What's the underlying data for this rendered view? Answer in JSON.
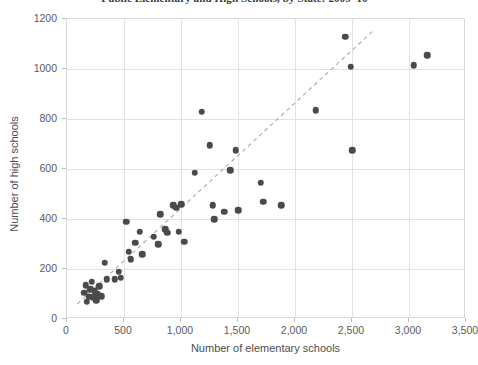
{
  "chart_data": {
    "type": "scatter",
    "title": "Public Elementary and High Schools, by State: 2009–10",
    "xlabel": "Number of elementary schools",
    "ylabel": "Number of high schools",
    "xlim": [
      0,
      3500
    ],
    "ylim": [
      0,
      1200
    ],
    "xticks": [
      0,
      500,
      1000,
      1500,
      2000,
      2500,
      3000,
      3500
    ],
    "xticklabels": [
      "0",
      "500",
      "1,000",
      "1,500",
      "2,000",
      "2,500",
      "3,000",
      "3,500"
    ],
    "yticks": [
      0,
      200,
      400,
      600,
      800,
      1000,
      1200
    ],
    "yticklabels": [
      "0",
      "200",
      "400",
      "600",
      "800",
      "1000",
      "1200"
    ],
    "grid": true,
    "legend": "none",
    "marker_color": "#4a4a4a",
    "trendline": {
      "style": "dashed",
      "color": "#b0b0b0",
      "x_start": 90,
      "y_start": 60,
      "x_end": 2690,
      "y_end": 1155
    },
    "points": [
      {
        "x": 150,
        "y": 105
      },
      {
        "x": 165,
        "y": 135
      },
      {
        "x": 175,
        "y": 70
      },
      {
        "x": 195,
        "y": 90
      },
      {
        "x": 205,
        "y": 120
      },
      {
        "x": 215,
        "y": 150
      },
      {
        "x": 230,
        "y": 88
      },
      {
        "x": 245,
        "y": 112
      },
      {
        "x": 255,
        "y": 75
      },
      {
        "x": 270,
        "y": 100
      },
      {
        "x": 285,
        "y": 132
      },
      {
        "x": 300,
        "y": 92
      },
      {
        "x": 330,
        "y": 225
      },
      {
        "x": 350,
        "y": 160
      },
      {
        "x": 420,
        "y": 160
      },
      {
        "x": 455,
        "y": 190
      },
      {
        "x": 470,
        "y": 165
      },
      {
        "x": 520,
        "y": 390
      },
      {
        "x": 540,
        "y": 270
      },
      {
        "x": 560,
        "y": 240
      },
      {
        "x": 600,
        "y": 305
      },
      {
        "x": 640,
        "y": 350
      },
      {
        "x": 660,
        "y": 260
      },
      {
        "x": 760,
        "y": 330
      },
      {
        "x": 800,
        "y": 300
      },
      {
        "x": 820,
        "y": 420
      },
      {
        "x": 860,
        "y": 360
      },
      {
        "x": 880,
        "y": 345
      },
      {
        "x": 930,
        "y": 455
      },
      {
        "x": 960,
        "y": 445
      },
      {
        "x": 980,
        "y": 350
      },
      {
        "x": 1000,
        "y": 460
      },
      {
        "x": 1030,
        "y": 310
      },
      {
        "x": 1120,
        "y": 585
      },
      {
        "x": 1180,
        "y": 830
      },
      {
        "x": 1250,
        "y": 695
      },
      {
        "x": 1280,
        "y": 455
      },
      {
        "x": 1290,
        "y": 400
      },
      {
        "x": 1380,
        "y": 430
      },
      {
        "x": 1430,
        "y": 595
      },
      {
        "x": 1480,
        "y": 675
      },
      {
        "x": 1500,
        "y": 435
      },
      {
        "x": 1700,
        "y": 545
      },
      {
        "x": 1720,
        "y": 470
      },
      {
        "x": 1880,
        "y": 455
      },
      {
        "x": 2180,
        "y": 835
      },
      {
        "x": 2440,
        "y": 1130
      },
      {
        "x": 2490,
        "y": 1010
      },
      {
        "x": 2500,
        "y": 675
      },
      {
        "x": 3040,
        "y": 1015
      },
      {
        "x": 3160,
        "y": 1055
      }
    ]
  }
}
